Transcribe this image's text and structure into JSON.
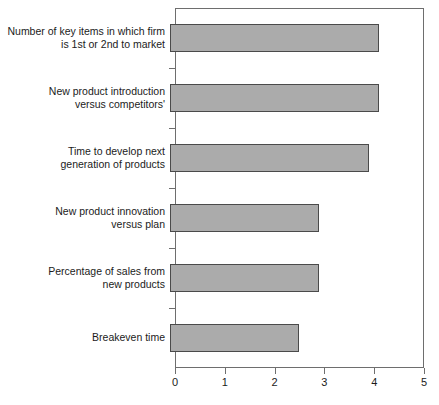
{
  "chart_data": {
    "type": "bar",
    "orientation": "horizontal",
    "title": "",
    "subtitle": "",
    "xlabel": "",
    "ylabel": "",
    "xlim": [
      0,
      5
    ],
    "xticks": [
      "0",
      "1",
      "2",
      "3",
      "4",
      "5"
    ],
    "grid": false,
    "legend": null,
    "bar_color": "#ababab",
    "bar_edge_color": "#4a4a4a",
    "axis_color": "#6e6e6e",
    "categories": [
      "Number of key items in which firm\nis 1st or 2nd to market",
      "New product introduction\nversus competitors'",
      "Time to develop next\ngeneration of products",
      "New product innovation\nversus plan",
      "Percentage of sales from\nnew products",
      "Breakeven time"
    ],
    "values": [
      4.2,
      4.2,
      4.0,
      3.0,
      3.0,
      2.6
    ]
  }
}
